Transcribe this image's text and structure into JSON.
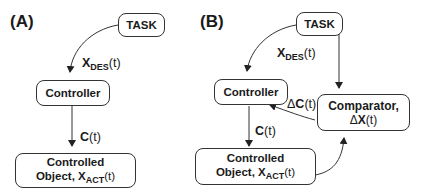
{
  "panels": {
    "a": {
      "label": "(A)",
      "task": "TASK",
      "controller": "Controller",
      "object_line1": "Controlled",
      "object_line2_prefix": "Object, ",
      "object_var": "X",
      "object_sub": "ACT",
      "object_suffix": "(t)",
      "edge_des_var": "X",
      "edge_des_sub": "DES",
      "edge_des_suffix": "(t)",
      "edge_c_var": "C",
      "edge_c_suffix": "(t)"
    },
    "b": {
      "label": "(B)",
      "task": "TASK",
      "controller": "Controller",
      "comparator_line1": "Comparator,",
      "comparator_delta": "Δ",
      "comparator_var": "X",
      "comparator_suffix": "(t)",
      "object_line1": "Controlled",
      "object_line2_prefix": "Object, ",
      "object_var": "X",
      "object_sub": "ACT",
      "object_suffix": "(t)",
      "edge_des_var": "X",
      "edge_des_sub": "DES",
      "edge_des_suffix": "(t)",
      "edge_c_var": "C",
      "edge_c_suffix": "(t)",
      "edge_dc_delta": "Δ",
      "edge_dc_var": "C",
      "edge_dc_suffix": "(t)"
    }
  }
}
